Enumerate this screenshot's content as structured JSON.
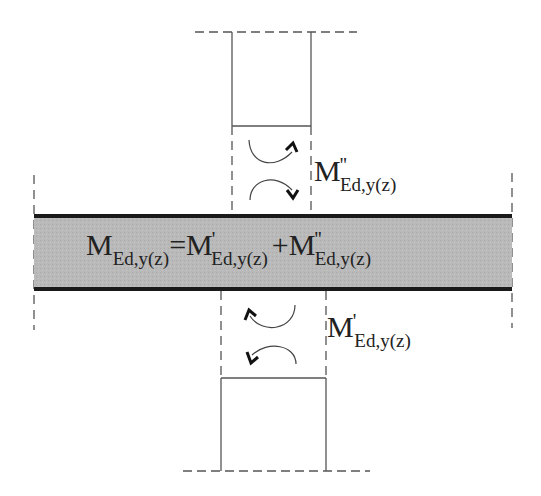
{
  "diagram": {
    "colors": {
      "beam_fill": "#b8b8b8",
      "beam_border": "#1a1a1a",
      "line": "#555555",
      "text": "#222222"
    },
    "equation": {
      "lhs_symbol": "M",
      "lhs_subscript": "Ed,y(z)",
      "equals": "=",
      "term1_symbol": "M",
      "term1_prime": "'",
      "term1_subscript": "Ed,y(z)",
      "plus": "+",
      "term2_symbol": "M",
      "term2_prime": "''",
      "term2_subscript": "Ed,y(z)"
    },
    "upper_label": {
      "symbol": "M",
      "prime": "''",
      "subscript": "Ed,y(z)"
    },
    "lower_label": {
      "symbol": "M",
      "prime": "'",
      "subscript": "Ed,y(z)"
    },
    "elements": {
      "upper_column": "column above joint",
      "beam": "beam",
      "lower_column": "column below joint",
      "upper_moment_arrows": [
        "clockwise-up",
        "clockwise-down"
      ],
      "lower_moment_arrows": [
        "counterclockwise-up",
        "counterclockwise-down"
      ]
    }
  }
}
